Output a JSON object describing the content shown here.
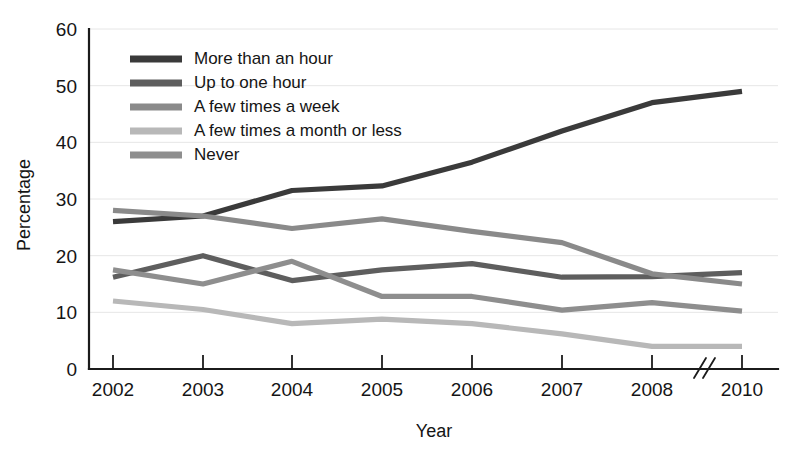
{
  "chart_data": {
    "type": "line",
    "title": "",
    "xlabel": "Year",
    "ylabel": "Percentage",
    "x": [
      "2002",
      "2003",
      "2004",
      "2005",
      "2006",
      "2007",
      "2008",
      "2010"
    ],
    "categories": [
      "2002",
      "2003",
      "2004",
      "2005",
      "2006",
      "2007",
      "2008",
      "2010"
    ],
    "xlim": [
      2002,
      2010
    ],
    "ylim": [
      0,
      60
    ],
    "yticks": [
      0,
      10,
      20,
      30,
      40,
      50,
      60
    ],
    "ytick_labels": [
      "0",
      "10",
      "20",
      "30",
      "40",
      "50",
      "60"
    ],
    "grid": true,
    "grid_axis": "y",
    "axis_break": {
      "present": true,
      "between": [
        "2008",
        "2010"
      ],
      "symbol": "//"
    },
    "legend_position": "upper-left-inside",
    "series": [
      {
        "name": "More than an hour",
        "color": "#3a3a3a",
        "values": [
          26.0,
          27.0,
          31.5,
          32.3,
          36.5,
          42.0,
          47.0,
          49.0
        ]
      },
      {
        "name": "Up to one hour",
        "color": "#5e5e5e",
        "values": [
          16.2,
          20.0,
          15.6,
          17.5,
          18.6,
          16.2,
          16.3,
          17.0
        ]
      },
      {
        "name": "A few times a week",
        "color": "#8a8a8a",
        "values": [
          28.0,
          27.0,
          24.8,
          26.5,
          24.3,
          22.3,
          16.8,
          15.0
        ]
      },
      {
        "name": "A few times a month or less",
        "color": "#b8b8b8",
        "values": [
          12.0,
          10.5,
          8.0,
          8.8,
          8.0,
          6.2,
          4.0,
          4.0
        ]
      },
      {
        "name": "Never",
        "color": "#8e8e8e",
        "values": [
          17.5,
          15.0,
          19.0,
          12.8,
          12.8,
          10.4,
          11.7,
          10.2
        ]
      }
    ]
  },
  "legend": {
    "entries": [
      {
        "label": "More than an hour"
      },
      {
        "label": "Up to one hour"
      },
      {
        "label": "A few times a week"
      },
      {
        "label": "A few times a month or less"
      },
      {
        "label": "Never"
      }
    ]
  }
}
